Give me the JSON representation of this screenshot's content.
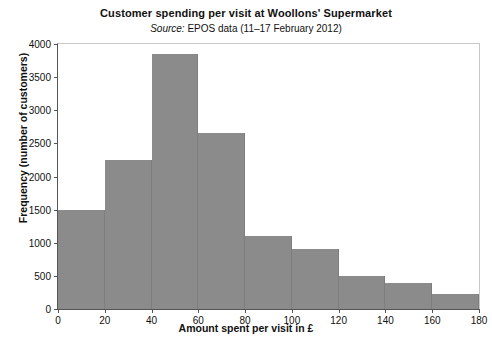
{
  "chart_data": {
    "type": "bar",
    "title": "Customer spending per visit at Woollons' Supermarket",
    "subtitle_label": "Source:",
    "subtitle_text": " EPOS data (11–17 February 2012)",
    "xlabel": "Amount spent per visit in £",
    "ylabel": "Frequency (number of customers)",
    "xlim": [
      0,
      180
    ],
    "ylim": [
      0,
      4000
    ],
    "grid": false,
    "legend": false,
    "bar_color": "#8b8b8b",
    "bin_width": 20,
    "categories": [
      "0–20",
      "20–40",
      "40–60",
      "60–80",
      "80–100",
      "100–120",
      "120–140",
      "140–160",
      "160–180"
    ],
    "bin_edges": [
      0,
      20,
      40,
      60,
      80,
      100,
      120,
      140,
      160,
      180
    ],
    "values": [
      1500,
      2250,
      3850,
      2650,
      1100,
      900,
      500,
      400,
      220
    ],
    "xticks": [
      "0",
      "20",
      "40",
      "60",
      "80",
      "100",
      "120",
      "140",
      "160",
      "180"
    ],
    "xtick_values": [
      0,
      20,
      40,
      60,
      80,
      100,
      120,
      140,
      160,
      180
    ],
    "yticks": [
      "0",
      "500",
      "1000",
      "1500",
      "2000",
      "2500",
      "3000",
      "3500",
      "4000"
    ],
    "ytick_values": [
      0,
      500,
      1000,
      1500,
      2000,
      2500,
      3000,
      3500,
      4000
    ]
  },
  "caption": ""
}
